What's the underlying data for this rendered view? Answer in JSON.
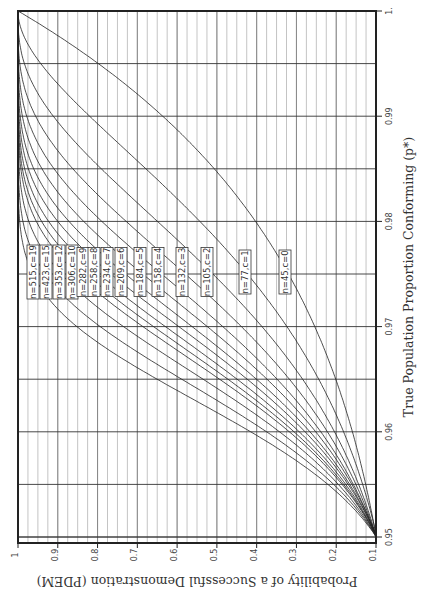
{
  "chart_data": {
    "type": "line",
    "orientation": "rotated-90-clockwise",
    "title": "",
    "xlabel": "True Population Proportion Conforming (p*)",
    "ylabel": "Probability of a Successful Demonstration (PDEM)",
    "xlim": [
      0.95,
      1.0
    ],
    "ylim": [
      0.1,
      1.0
    ],
    "x_ticks": [
      "0.95",
      "0.96",
      "0.97",
      "0.98",
      "0.99",
      "1."
    ],
    "y_ticks": [
      "0.1",
      "0.2",
      "0.3",
      "0.4",
      "0.5",
      "0.6",
      "0.7",
      "0.8",
      "0.9",
      "1"
    ],
    "grid": true,
    "x_minor_step": 0.00125,
    "y_minor_step": 0.1,
    "series": [
      {
        "name": "n=515,c=19",
        "n": 515,
        "c": 19
      },
      {
        "name": "n=423,c=15",
        "n": 423,
        "c": 15
      },
      {
        "name": "n=353,c=12",
        "n": 353,
        "c": 12
      },
      {
        "name": "n=306,c=10",
        "n": 306,
        "c": 10
      },
      {
        "name": "n=282,c=9",
        "n": 282,
        "c": 9
      },
      {
        "name": "n=258,c=8",
        "n": 258,
        "c": 8
      },
      {
        "name": "n=234,c=7",
        "n": 234,
        "c": 7
      },
      {
        "name": "n=209,c=6",
        "n": 209,
        "c": 6
      },
      {
        "name": "n=184,c=5",
        "n": 184,
        "c": 5
      },
      {
        "name": "n=158,c=4",
        "n": 158,
        "c": 4
      },
      {
        "name": "n=132,c=3",
        "n": 132,
        "c": 3
      },
      {
        "name": "n=105,c=2",
        "n": 105,
        "c": 2
      },
      {
        "name": "n=77,c=1",
        "n": 77,
        "c": 1
      },
      {
        "name": "n=45,c=0",
        "n": 45,
        "c": 0
      }
    ],
    "curve_formula": "PDEM = P(X <= c), X ~ Binomial(n, 1 - p*)",
    "annotations": {
      "label_screen_x": [
        33,
        46,
        59,
        72,
        83,
        94,
        107,
        121,
        140,
        158,
        182,
        207,
        245,
        285
      ]
    }
  }
}
